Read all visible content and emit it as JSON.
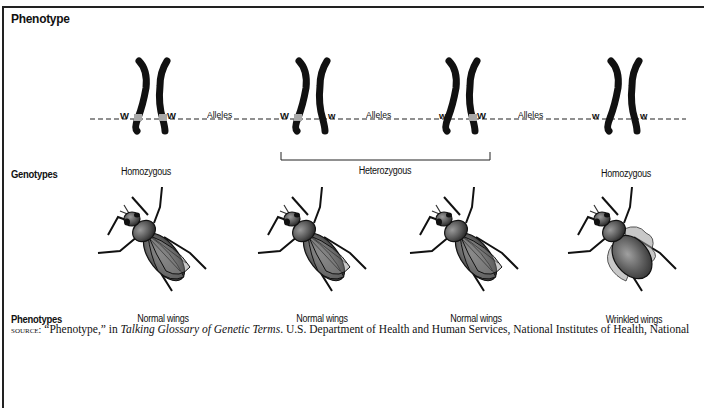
{
  "title": "Phenotype",
  "row_labels": {
    "genotypes": "Genotypes",
    "phenotypes": "Phenotypes"
  },
  "alleles_label": "Alleles",
  "chromosome_pairs": [
    {
      "left_allele": "W",
      "right_allele": "W",
      "genotype": "Homozygous",
      "phenotype": "Normal wings"
    },
    {
      "left_allele": "W",
      "right_allele": "w",
      "genotype": "Heterozygous",
      "phenotype": "Normal wings"
    },
    {
      "left_allele": "w",
      "right_allele": "W",
      "genotype": "Heterozygous",
      "phenotype": "Normal wings"
    },
    {
      "left_allele": "w",
      "right_allele": "w",
      "genotype": "Homozygous",
      "phenotype": "Wrinkled wings"
    }
  ],
  "genotype_labels": {
    "left": "Homozygous",
    "middle": "Heterozygous",
    "right": "Homozygous"
  },
  "source": {
    "prefix": "source:",
    "quote": " “Phenotype,” in ",
    "work": "Talking Glossary of Genetic Terms",
    "rest": ". U.S. Department of Health and Human Services, National Institutes of Health, National"
  },
  "colors": {
    "chromosome": "#111111",
    "allele_band": "#a8a8a8",
    "fly_body": "#5a5a5a",
    "wing": "#8a8a8a"
  }
}
